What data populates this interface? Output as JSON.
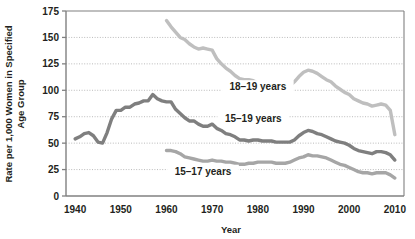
{
  "chart_data": {
    "type": "line",
    "title": "",
    "xlabel": "Year",
    "ylabel": "Rate per 1,000 Women in Specified Age Group",
    "ylabel_line1": "Rate per 1,000 Women in Specified",
    "ylabel_line2": "Age Group",
    "xlim": [
      1938,
      2012
    ],
    "ylim": [
      0,
      175
    ],
    "yticks": [
      0,
      25,
      50,
      75,
      100,
      125,
      150,
      175
    ],
    "ytick_labels": [
      "0",
      "25",
      "50",
      "75",
      "100",
      "125",
      "150",
      "175"
    ],
    "xticks": [
      1940,
      1950,
      1960,
      1970,
      1980,
      1990,
      2000,
      2010
    ],
    "xtick_labels": [
      "1940",
      "1950",
      "1960",
      "1970",
      "1980",
      "1990",
      "2000",
      "2010"
    ],
    "grid": true,
    "grid_style": "dotted-horizontal",
    "legend_position": "inline-annotations",
    "colors": {
      "series_18_19": "#bfbfbf",
      "series_15_19": "#7f7f7f",
      "series_15_17": "#a6a6a6",
      "axis": "#808080",
      "grid": "#b3b3b3",
      "text": "#231f20"
    },
    "annotations": [
      {
        "text": "18–19 years",
        "x": 1980,
        "y": 102
      },
      {
        "text": "15–19 years",
        "x": 1979,
        "y": 72
      },
      {
        "text": "15–17 years",
        "x": 1968,
        "y": 22
      }
    ],
    "series": [
      {
        "name": "18–19 years",
        "color": "#bfbfbf",
        "x": [
          1960,
          1961,
          1962,
          1963,
          1964,
          1965,
          1966,
          1967,
          1968,
          1969,
          1970,
          1971,
          1972,
          1973,
          1974,
          1975,
          1976,
          1977,
          1978,
          1979,
          1980,
          1981,
          1982,
          1983,
          1984,
          1985,
          1986,
          1987,
          1988,
          1989,
          1990,
          1991,
          1992,
          1993,
          1994,
          1995,
          1996,
          1997,
          1998,
          1999,
          2000,
          2001,
          2002,
          2003,
          2004,
          2005,
          2006,
          2007,
          2008,
          2009,
          2010
        ],
        "values": [
          166,
          160,
          155,
          150,
          148,
          144,
          141,
          139,
          140,
          139,
          138,
          130,
          125,
          121,
          118,
          114,
          111,
          110,
          110,
          109,
          107,
          105,
          103,
          101,
          100,
          100,
          102,
          104,
          108,
          113,
          117,
          119,
          118,
          116,
          113,
          110,
          108,
          104,
          101,
          98,
          96,
          92,
          90,
          88,
          87,
          85,
          86,
          87,
          86,
          81,
          58
        ]
      },
      {
        "name": "15–19 years",
        "color": "#7f7f7f",
        "x": [
          1940,
          1941,
          1942,
          1943,
          1944,
          1945,
          1946,
          1947,
          1948,
          1949,
          1950,
          1951,
          1952,
          1953,
          1954,
          1955,
          1956,
          1957,
          1958,
          1959,
          1960,
          1961,
          1962,
          1963,
          1964,
          1965,
          1966,
          1967,
          1968,
          1969,
          1970,
          1971,
          1972,
          1973,
          1974,
          1975,
          1976,
          1977,
          1978,
          1979,
          1980,
          1981,
          1982,
          1983,
          1984,
          1985,
          1986,
          1987,
          1988,
          1989,
          1990,
          1991,
          1992,
          1993,
          1994,
          1995,
          1996,
          1997,
          1998,
          1999,
          2000,
          2001,
          2002,
          2003,
          2004,
          2005,
          2006,
          2007,
          2008,
          2009,
          2010
        ],
        "values": [
          54,
          56,
          59,
          60,
          57,
          51,
          50,
          60,
          73,
          81,
          81,
          84,
          84,
          87,
          88,
          90,
          90,
          96,
          92,
          90,
          89,
          89,
          82,
          78,
          74,
          71,
          71,
          68,
          66,
          66,
          68,
          64,
          62,
          59,
          58,
          56,
          53,
          53,
          52,
          53,
          53,
          52,
          52,
          52,
          51,
          51,
          51,
          51,
          53,
          57,
          60,
          62,
          61,
          59,
          58,
          56,
          54,
          52,
          51,
          50,
          48,
          45,
          43,
          42,
          41,
          40,
          42,
          42,
          41,
          39,
          34
        ]
      },
      {
        "name": "15–17 years",
        "color": "#a6a6a6",
        "x": [
          1960,
          1961,
          1962,
          1963,
          1964,
          1965,
          1966,
          1967,
          1968,
          1969,
          1970,
          1971,
          1972,
          1973,
          1974,
          1975,
          1976,
          1977,
          1978,
          1979,
          1980,
          1981,
          1982,
          1983,
          1984,
          1985,
          1986,
          1987,
          1988,
          1989,
          1990,
          1991,
          1992,
          1993,
          1994,
          1995,
          1996,
          1997,
          1998,
          1999,
          2000,
          2001,
          2002,
          2003,
          2004,
          2005,
          2006,
          2007,
          2008,
          2009,
          2010
        ],
        "values": [
          43,
          43,
          42,
          40,
          37,
          36,
          35,
          34,
          33,
          33,
          34,
          33,
          33,
          32,
          32,
          31,
          30,
          30,
          31,
          31,
          32,
          32,
          32,
          32,
          31,
          31,
          31,
          32,
          34,
          36,
          37,
          39,
          38,
          38,
          37,
          36,
          34,
          32,
          30,
          29,
          27,
          25,
          23,
          22,
          22,
          21,
          22,
          22,
          22,
          20,
          17
        ]
      }
    ]
  }
}
